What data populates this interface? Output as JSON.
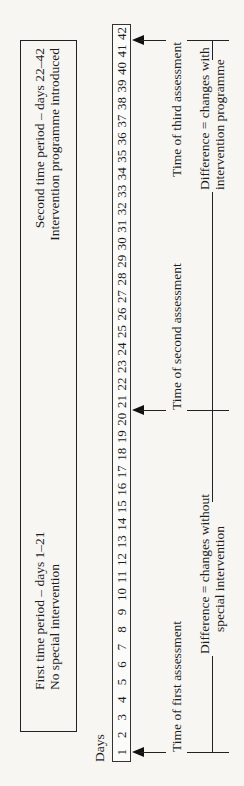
{
  "diagram": {
    "orientation": "rotated 90 degrees counter-clockwise",
    "periods": [
      {
        "line1": "First time period – days 1–21",
        "line2": "No special intervention"
      },
      {
        "line1": "Second time period – days 22–42",
        "line2": "Intervention programme introduced"
      }
    ],
    "days_label": "Days",
    "days": [
      "1",
      "2",
      "3",
      "4",
      "5",
      "6",
      "7",
      "8",
      "9",
      "10",
      "11",
      "12",
      "13",
      "14",
      "15",
      "16",
      "17",
      "18",
      "19",
      "20",
      "21",
      "22",
      "23",
      "24",
      "25",
      "26",
      "27",
      "28",
      "29",
      "30",
      "31",
      "32",
      "33",
      "34",
      "35",
      "36",
      "37",
      "38",
      "39",
      "40",
      "41",
      "42"
    ],
    "assessments": [
      {
        "label": "Time of first assessment",
        "day": "1"
      },
      {
        "label": "Time of second assessment",
        "day": "22"
      },
      {
        "label": "Time of third assessment",
        "day": "42"
      }
    ],
    "differences": [
      {
        "line1": "Difference = changes without",
        "line2": "special intervention"
      },
      {
        "line1": "Difference = changes with",
        "line2": "intervention programme"
      }
    ],
    "colors": {
      "line": "#222222",
      "background": "#f7f6f3"
    }
  }
}
